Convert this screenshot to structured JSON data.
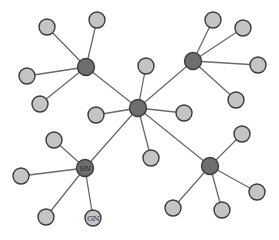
{
  "diagram": {
    "type": "star-network",
    "width": 279,
    "height": 240,
    "colors": {
      "background": "#ffffff",
      "edge": "#6a6a6a",
      "hub_fill": "#6e6e6e",
      "leaf_fill": "#c4c4c4",
      "node_stroke": "#3c3c3c",
      "hub_label": "#2a2a2a",
      "leaf_label": "#3a3a3a"
    },
    "radii": {
      "hub": 8.5,
      "leaf": 8
    },
    "nodes": [
      {
        "id": "c",
        "kind": "hub",
        "x": 138,
        "y": 108,
        "label": ""
      },
      {
        "id": "h1",
        "kind": "hub",
        "x": 86,
        "y": 67,
        "label": ""
      },
      {
        "id": "h2",
        "kind": "hub",
        "x": 193,
        "y": 61,
        "label": ""
      },
      {
        "id": "h3",
        "kind": "hub",
        "x": 85,
        "y": 168,
        "label": "SN"
      },
      {
        "id": "h4",
        "kind": "hub",
        "x": 210,
        "y": 166,
        "label": ""
      },
      {
        "id": "l1",
        "kind": "leaf",
        "x": 47,
        "y": 27,
        "label": ""
      },
      {
        "id": "l2",
        "kind": "leaf",
        "x": 97,
        "y": 20,
        "label": ""
      },
      {
        "id": "l3",
        "kind": "leaf",
        "x": 27,
        "y": 76,
        "label": ""
      },
      {
        "id": "l4",
        "kind": "leaf",
        "x": 40,
        "y": 104,
        "label": ""
      },
      {
        "id": "l5",
        "kind": "leaf",
        "x": 213,
        "y": 20,
        "label": ""
      },
      {
        "id": "l6",
        "kind": "leaf",
        "x": 243,
        "y": 28,
        "label": ""
      },
      {
        "id": "l7",
        "kind": "leaf",
        "x": 258,
        "y": 65,
        "label": ""
      },
      {
        "id": "l8",
        "kind": "leaf",
        "x": 236,
        "y": 100,
        "label": ""
      },
      {
        "id": "l9",
        "kind": "leaf",
        "x": 146,
        "y": 66,
        "label": ""
      },
      {
        "id": "l10",
        "kind": "leaf",
        "x": 96,
        "y": 115,
        "label": ""
      },
      {
        "id": "l11",
        "kind": "leaf",
        "x": 184,
        "y": 113,
        "label": ""
      },
      {
        "id": "l12",
        "kind": "leaf",
        "x": 151,
        "y": 158,
        "label": ""
      },
      {
        "id": "l13",
        "kind": "leaf",
        "x": 54,
        "y": 140,
        "label": ""
      },
      {
        "id": "l14",
        "kind": "leaf",
        "x": 21,
        "y": 176,
        "label": ""
      },
      {
        "id": "l15",
        "kind": "leaf",
        "x": 46,
        "y": 217,
        "label": ""
      },
      {
        "id": "l16",
        "kind": "leaf",
        "x": 93,
        "y": 218,
        "label": "GN"
      },
      {
        "id": "l17",
        "kind": "leaf",
        "x": 242,
        "y": 134,
        "label": ""
      },
      {
        "id": "l18",
        "kind": "leaf",
        "x": 257,
        "y": 192,
        "label": ""
      },
      {
        "id": "l19",
        "kind": "leaf",
        "x": 173,
        "y": 208,
        "label": ""
      },
      {
        "id": "l20",
        "kind": "leaf",
        "x": 222,
        "y": 210,
        "label": ""
      }
    ],
    "edges": [
      [
        "c",
        "h1"
      ],
      [
        "c",
        "h2"
      ],
      [
        "c",
        "h3"
      ],
      [
        "c",
        "h4"
      ],
      [
        "c",
        "l9"
      ],
      [
        "c",
        "l10"
      ],
      [
        "c",
        "l11"
      ],
      [
        "c",
        "l12"
      ],
      [
        "h1",
        "l1"
      ],
      [
        "h1",
        "l2"
      ],
      [
        "h1",
        "l3"
      ],
      [
        "h1",
        "l4"
      ],
      [
        "h2",
        "l5"
      ],
      [
        "h2",
        "l6"
      ],
      [
        "h2",
        "l7"
      ],
      [
        "h2",
        "l8"
      ],
      [
        "h3",
        "l13"
      ],
      [
        "h3",
        "l14"
      ],
      [
        "h3",
        "l15"
      ],
      [
        "h3",
        "l16"
      ],
      [
        "h4",
        "l17"
      ],
      [
        "h4",
        "l18"
      ],
      [
        "h4",
        "l19"
      ],
      [
        "h4",
        "l20"
      ]
    ]
  }
}
